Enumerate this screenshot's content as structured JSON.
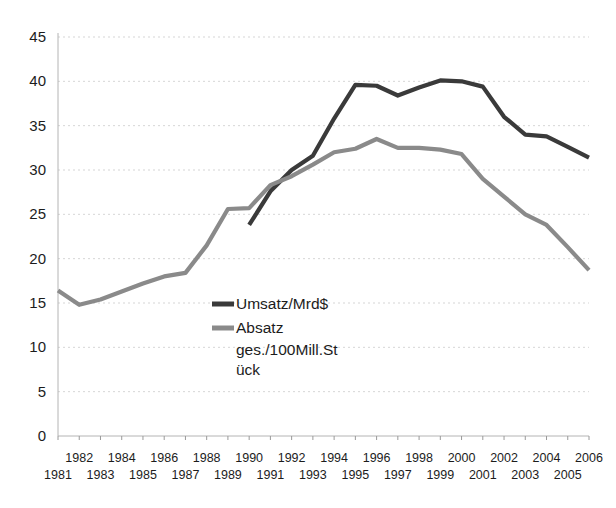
{
  "chart_data": {
    "type": "line",
    "title": "",
    "subtitle": "",
    "xlabel": "",
    "ylabel": "",
    "xlim": [
      1981,
      2006
    ],
    "ylim": [
      0,
      45
    ],
    "grid": true,
    "legend_position": "center-left-inside",
    "y_ticks": [
      0,
      5,
      10,
      15,
      20,
      25,
      30,
      35,
      40,
      45
    ],
    "x_ticks_upper": [
      "1982",
      "1984",
      "1986",
      "1988",
      "1990",
      "1992",
      "1994",
      "1996",
      "1998",
      "2000",
      "2002",
      "2004",
      "2006"
    ],
    "x_ticks_lower": [
      "1981",
      "1983",
      "1985",
      "1987",
      "1989",
      "1991",
      "1993",
      "1995",
      "1997",
      "1999",
      "2001",
      "2003",
      "2005"
    ],
    "x": [
      1981,
      1982,
      1983,
      1984,
      1985,
      1986,
      1987,
      1988,
      1989,
      1990,
      1991,
      1992,
      1993,
      1994,
      1995,
      1996,
      1997,
      1998,
      1999,
      2000,
      2001,
      2002,
      2003,
      2004,
      2005,
      2006
    ],
    "series": [
      {
        "name": "Umsatz/Mrd$",
        "color": "#3a3a3a",
        "stroke_width": 4.2,
        "start_year": 1990,
        "values": [
          null,
          null,
          null,
          null,
          null,
          null,
          null,
          null,
          null,
          23.8,
          27.6,
          30.0,
          31.6,
          35.8,
          39.6,
          39.5,
          38.4,
          39.3,
          40.1,
          40.0,
          39.4,
          36.0,
          34.0,
          33.8,
          32.6,
          31.4
        ]
      },
      {
        "name": "Absatz ges./100Mill.Stück",
        "color": "#8a8a8a",
        "stroke_width": 4.2,
        "start_year": 1981,
        "values": [
          16.4,
          14.8,
          15.4,
          16.3,
          17.2,
          18.0,
          18.4,
          21.5,
          25.6,
          25.7,
          28.3,
          29.3,
          30.6,
          32.0,
          32.4,
          33.5,
          32.5,
          32.5,
          32.3,
          31.8,
          29.0,
          27.0,
          25.0,
          23.8,
          21.3,
          18.7
        ]
      }
    ],
    "legend": [
      {
        "label": "Umsatz/Mrd$",
        "color": "#3a3a3a"
      },
      {
        "label": "Absatz",
        "color": "#8a8a8a"
      },
      {
        "label": "ges./100Mill.St",
        "color": null
      },
      {
        "label": "ück",
        "color": null
      }
    ]
  },
  "colors": {
    "series_dark": "#3a3a3a",
    "series_gray": "#8a8a8a",
    "grid": "#c9c9c9",
    "text": "#1c1c1c",
    "background": "#ffffff"
  }
}
